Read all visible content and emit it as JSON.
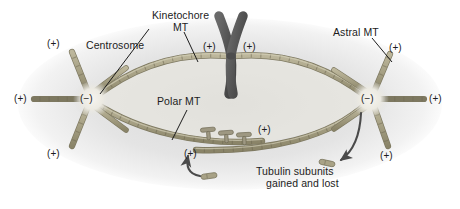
{
  "figure": {
    "kind": "mitotic-spindle-diagram",
    "background_color": "#ffffff",
    "cell_body_color": "#e2e2e2",
    "microtubule_color": "#a8a286",
    "microtubule_edge_color": "#7d7860",
    "chromosome_color": "#575757",
    "motor_protein_color": "#8d8872",
    "text_color": "#1c1c1c",
    "leader_line_color": "#1c1c1c",
    "arrow_color": "#4a4a4a"
  },
  "labels": {
    "centrosome": "Centrosome",
    "kinetochore_mt_line1": "Kinetochore",
    "kinetochore_mt_line2": "MT",
    "polar_mt": "Polar MT",
    "astral_mt": "Astral MT",
    "tubulin_line1": "Tubulin subunits",
    "tubulin_line2": "gained and lost"
  },
  "polarity": {
    "plus": "(+)",
    "minus": "(−)"
  },
  "plus_markers": [
    {
      "id": "left-astral-upper",
      "text": "(+)",
      "x": 47,
      "y": 38
    },
    {
      "id": "left-astral-left",
      "text": "(+)",
      "x": 14,
      "y": 93
    },
    {
      "id": "left-astral-lower",
      "text": "(+)",
      "x": 47,
      "y": 148
    },
    {
      "id": "kinetochore-left",
      "text": "(+)",
      "x": 203,
      "y": 41
    },
    {
      "id": "kinetochore-right",
      "text": "(+)",
      "x": 243,
      "y": 41
    },
    {
      "id": "polar-right-upper",
      "text": "(+)",
      "x": 258,
      "y": 124
    },
    {
      "id": "polar-left-lower",
      "text": "(+)",
      "x": 184,
      "y": 148
    },
    {
      "id": "right-astral-upper",
      "text": "(+)",
      "x": 389,
      "y": 42
    },
    {
      "id": "right-astral-right",
      "text": "(+)",
      "x": 429,
      "y": 93
    },
    {
      "id": "right-astral-lower",
      "text": "(+)",
      "x": 380,
      "y": 150
    }
  ],
  "minus_markers": [
    {
      "id": "left-centrosome-minus",
      "text": "(−)",
      "x": 80,
      "y": 93
    },
    {
      "id": "right-centrosome-minus",
      "text": "(−)",
      "x": 361,
      "y": 93
    }
  ],
  "structures": {
    "left_centrosome": {
      "cx": 92,
      "cy": 99
    },
    "right_centrosome": {
      "cx": 370,
      "cy": 99
    },
    "chromosome": {
      "cx": 231,
      "cy": 55
    },
    "motor_crosslinkers_count": 3,
    "free_tubulin_subunits_count": 2,
    "curved_arrows": [
      "gain-arrow-up",
      "loss-arrow-down"
    ]
  }
}
